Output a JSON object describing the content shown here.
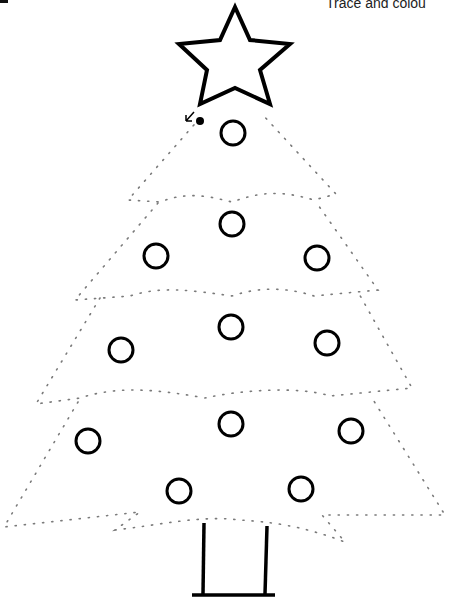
{
  "worksheet": {
    "title": "Trace and colou",
    "subject": "christmas-tree",
    "colors": {
      "ink": "#000000",
      "dots": "#7a7a7a",
      "background": "#ffffff"
    }
  },
  "star": {
    "cx": 235,
    "cy": 60,
    "outer_r": 55,
    "inner_r": 23
  },
  "start_marker": {
    "x": 200,
    "y": 121,
    "arrow": "↙"
  },
  "ornaments": [
    {
      "cx": 233,
      "cy": 133
    },
    {
      "cx": 232,
      "cy": 224
    },
    {
      "cx": 156,
      "cy": 256
    },
    {
      "cx": 317,
      "cy": 258
    },
    {
      "cx": 231,
      "cy": 327
    },
    {
      "cx": 121,
      "cy": 350
    },
    {
      "cx": 327,
      "cy": 343
    },
    {
      "cx": 231,
      "cy": 424
    },
    {
      "cx": 88,
      "cy": 441
    },
    {
      "cx": 351,
      "cy": 431
    },
    {
      "cx": 179,
      "cy": 491
    },
    {
      "cx": 301,
      "cy": 489
    }
  ],
  "trunk": {
    "left_x": 204,
    "right_x": 267,
    "top_y": 522,
    "bottom_y": 595
  }
}
